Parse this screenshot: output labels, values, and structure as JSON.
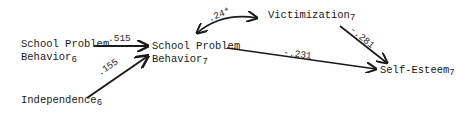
{
  "diagram": {
    "type": "path-diagram",
    "nodes": {
      "spb6": {
        "line1": "School Problem",
        "line2": "Behavior",
        "sub": "6"
      },
      "ind6": {
        "line1": "Independence",
        "sub": "6"
      },
      "spb7": {
        "line1": "School Problem",
        "line2": "Behavior",
        "sub": "7"
      },
      "vic7": {
        "line1": "Victimization",
        "sub": "7"
      },
      "se7": {
        "line1": "Self-Esteem",
        "sub": "7"
      }
    },
    "edges": {
      "spb6_spb7": {
        "from": "School Problem Behavior6",
        "to": "School Problem Behavior7",
        "coef": ".515"
      },
      "ind6_spb7": {
        "from": "Independence6",
        "to": "School Problem Behavior7",
        "coef": ".155"
      },
      "spb7_vic7": {
        "from": "School Problem Behavior7",
        "to": "Victimization7",
        "coef": ".24*",
        "bidirectional": true
      },
      "vic7_se7": {
        "from": "Victimization7",
        "to": "Self-Esteem7",
        "coef": "-.281"
      },
      "spb7_se7": {
        "from": "School Problem Behavior7",
        "to": "Self-Esteem7",
        "coef": "-.231"
      }
    },
    "colors": {
      "line": "#1a1a1a",
      "text": "#1a1a1a"
    }
  }
}
